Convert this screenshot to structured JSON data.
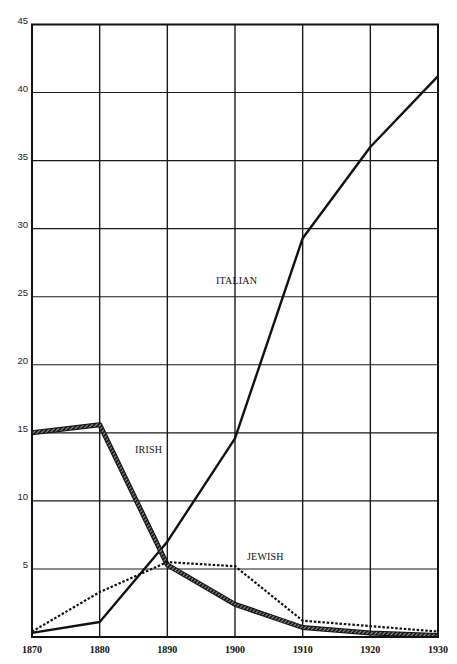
{
  "chart_data": {
    "type": "line",
    "title": "",
    "xlabel": "",
    "ylabel": "",
    "x": [
      1870,
      1880,
      1890,
      1900,
      1910,
      1920,
      1930
    ],
    "x_tick_labels": [
      "1870",
      "1880",
      "1890",
      "1900",
      "1910",
      "1920",
      "1930"
    ],
    "y_tick_labels": [
      "5",
      "10",
      "15",
      "20",
      "25",
      "30",
      "35",
      "40",
      "45"
    ],
    "ylim": [
      0,
      45
    ],
    "xlim": [
      1870,
      1930
    ],
    "grid": true,
    "legend_position": "inline-labels",
    "series": [
      {
        "name": "ITALIAN",
        "style": "solid",
        "values": [
          0.3,
          1.1,
          7.0,
          14.6,
          29.3,
          36.0,
          41.2
        ],
        "label_pos": {
          "x": 216,
          "y": 284
        }
      },
      {
        "name": "IRISH",
        "style": "thick-hatched",
        "values": [
          15.0,
          15.6,
          5.3,
          2.4,
          0.7,
          0.3,
          0.1
        ],
        "label_pos": {
          "x": 135,
          "y": 453
        }
      },
      {
        "name": "JEWISH",
        "style": "dotted",
        "values": [
          0.4,
          3.3,
          5.5,
          5.2,
          1.2,
          0.8,
          0.4
        ],
        "label_pos": {
          "x": 247,
          "y": 560
        }
      }
    ]
  },
  "layout": {
    "plot_left": 32,
    "plot_right": 438,
    "plot_top": 24.5,
    "plot_bottom": 637
  },
  "colors": {
    "line": "#111111",
    "grid": "#1a1a1a",
    "background": "#ffffff"
  }
}
